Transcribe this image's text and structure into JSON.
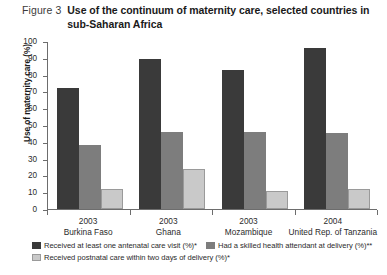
{
  "figure": {
    "label": "Figure 3",
    "title": "Use of the continuum of maternity care, selected countries in sub-Saharan Africa"
  },
  "chart_data": {
    "type": "bar",
    "title": "Use of the continuum of maternity care, selected countries in sub-Saharan Africa",
    "xlabel": "",
    "ylabel": "Use of maternity care (%)",
    "ylim": [
      0,
      100
    ],
    "ytick_step": 10,
    "yticks": [
      0,
      10,
      20,
      30,
      40,
      50,
      60,
      70,
      80,
      90,
      100
    ],
    "ytick_labels": [
      "0",
      "10",
      "20",
      "30",
      "40",
      "50",
      "60",
      "70",
      "80",
      "90",
      "100"
    ],
    "grid": false,
    "legend_position": "bottom",
    "categories": [
      "Burkina Faso",
      "Ghana",
      "Mozambique",
      "United Rep. of Tanzania"
    ],
    "category_years": [
      "2003",
      "2003",
      "2003",
      "2004"
    ],
    "series": [
      {
        "name": "Received at least one antenatal care visit (%)*",
        "color": "#3a3a3a",
        "values": [
          72,
          89,
          83,
          96
        ]
      },
      {
        "name": "Had a skilled health attendant at delivery (%)**",
        "color": "#7d7d7d",
        "values": [
          38,
          46,
          46,
          45
        ]
      },
      {
        "name": "Received postnatal care within two days of delivery (%)*",
        "color": "#c9c9c9",
        "values": [
          12,
          24,
          11,
          12
        ]
      }
    ]
  }
}
